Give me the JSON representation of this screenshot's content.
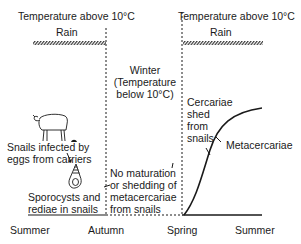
{
  "header": {
    "left_temperature": "Temperature above 10°C",
    "right_temperature": "Temperature above 10°C",
    "left_rain": "Rain",
    "right_rain": "Rain"
  },
  "winter": {
    "line1": "Winter",
    "line2": "(Temperature",
    "line3": "below 10°C)"
  },
  "labels": {
    "snails_infected_line1": "Snails infected by",
    "snails_infected_line2": "eggs from carriers",
    "sporocysts_line1": "Sporocysts and",
    "sporocysts_line2": "rediae in snails",
    "no_maturation_line1": "No maturation",
    "no_maturation_line2": "or shedding of",
    "no_maturation_line3": "metacercariae",
    "no_maturation_line4": "from snails",
    "cercariae_line1": "Cercariae",
    "cercariae_line2": "shed",
    "cercariae_line3": "from",
    "cercariae_line4": "snails",
    "metacercariae": "Metacercariae"
  },
  "seasons": [
    "Summer",
    "Autumn",
    "Spring",
    "Summer"
  ],
  "icons": {
    "sheep": "sheep-icon",
    "snail": "snail-icon",
    "egg": "egg-icon"
  },
  "colors": {
    "ink": "#1a1a1a",
    "background": "#ffffff"
  }
}
